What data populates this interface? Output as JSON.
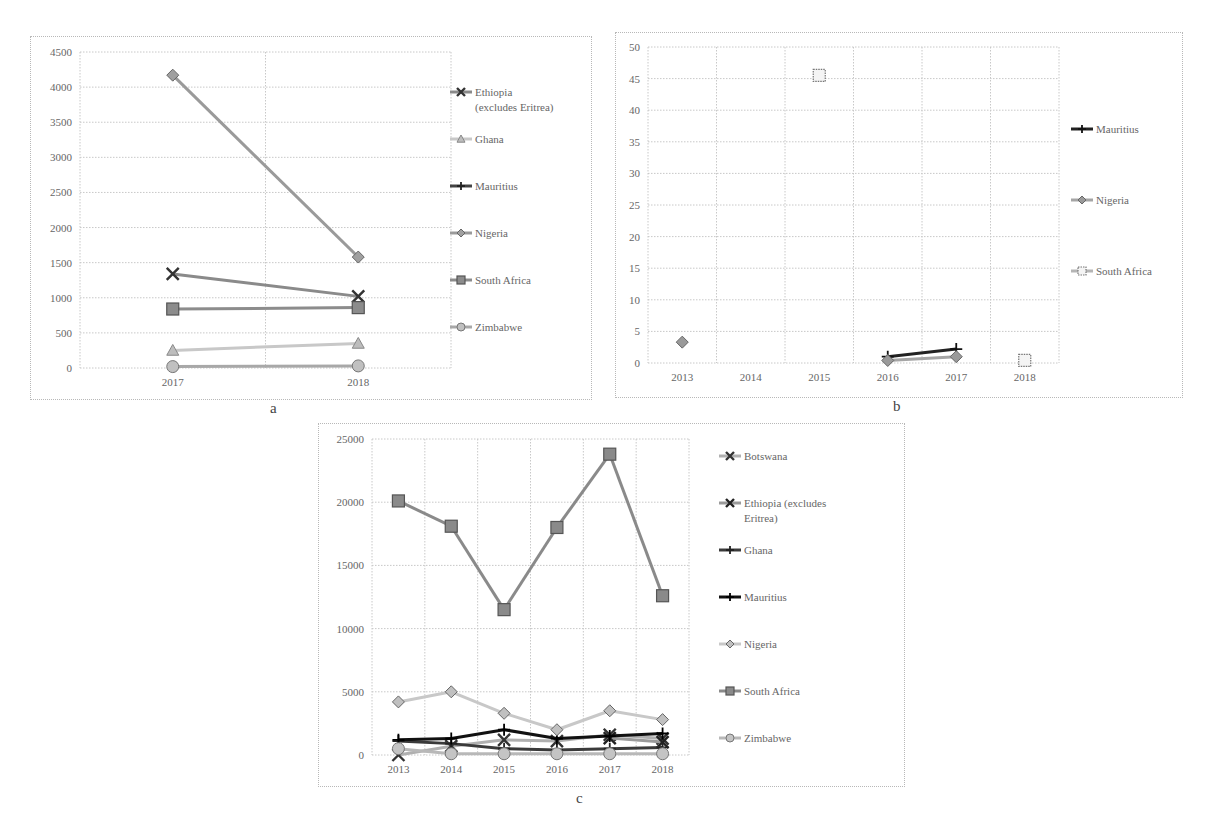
{
  "figure": {
    "captions": [
      "a",
      "b",
      "c"
    ]
  },
  "chart_data": [
    {
      "id": "a",
      "type": "line",
      "title": "",
      "xlabel": "",
      "ylabel": "",
      "categories": [
        "2017",
        "2018"
      ],
      "ylim": [
        0,
        4500
      ],
      "yticks": [
        0,
        500,
        1000,
        1500,
        2000,
        2500,
        3000,
        3500,
        4000,
        4500
      ],
      "grid": true,
      "legend_position": "right",
      "series": [
        {
          "name": "Ethiopia (excludes Eritrea)",
          "legend_lines": [
            "Ethiopia",
            "(excludes Eritrea)"
          ],
          "marker": "x",
          "color": "#8a8a8a",
          "marker_color": "#333333",
          "values": [
            1340,
            1020
          ]
        },
        {
          "name": "Ghana",
          "legend_lines": [
            "Ghana"
          ],
          "marker": "triangle",
          "color": "#c8c8c8",
          "marker_color": "#bdbdbd",
          "values": [
            250,
            350
          ]
        },
        {
          "name": "Mauritius",
          "legend_lines": [
            "Mauritius"
          ],
          "marker": "plus",
          "color": "#444444",
          "marker_color": "#222222",
          "values": [
            null,
            null
          ]
        },
        {
          "name": "Nigeria",
          "legend_lines": [
            "Nigeria"
          ],
          "marker": "diamond",
          "color": "#9a9a9a",
          "marker_color": "#a0a0a0",
          "values": [
            4170,
            1580
          ]
        },
        {
          "name": "South Africa",
          "legend_lines": [
            "South Africa"
          ],
          "marker": "square",
          "color": "#8c8c8c",
          "marker_color": "#8c8c8c",
          "values": [
            840,
            860
          ]
        },
        {
          "name": "Zimbabwe",
          "legend_lines": [
            "Zimbabwe"
          ],
          "marker": "circle",
          "color": "#a8a8a8",
          "marker_color": "#c0c0c0",
          "values": [
            20,
            30
          ]
        }
      ]
    },
    {
      "id": "b",
      "type": "line",
      "title": "",
      "xlabel": "",
      "ylabel": "",
      "categories": [
        "2013",
        "2014",
        "2015",
        "2016",
        "2017",
        "2018"
      ],
      "ylim": [
        0,
        50
      ],
      "yticks": [
        0,
        5,
        10,
        15,
        20,
        25,
        30,
        35,
        40,
        45,
        50
      ],
      "grid": true,
      "legend_position": "right",
      "series": [
        {
          "name": "Mauritius",
          "legend_lines": [
            "Mauritius"
          ],
          "marker": "plus",
          "color": "#222222",
          "marker_color": "#111111",
          "values": [
            null,
            null,
            null,
            1.0,
            2.2,
            null
          ]
        },
        {
          "name": "Nigeria",
          "legend_lines": [
            "Nigeria"
          ],
          "marker": "diamond",
          "color": "#a5a5a5",
          "marker_color": "#9a9a9a",
          "values": [
            3.3,
            null,
            null,
            0.4,
            1.0,
            null
          ]
        },
        {
          "name": "South Africa",
          "legend_lines": [
            "South Africa"
          ],
          "marker": "square-open",
          "color": "#b5b5b5",
          "marker_color": "#8a8a8a",
          "values": [
            null,
            null,
            45.5,
            null,
            null,
            0.4
          ]
        }
      ]
    },
    {
      "id": "c",
      "type": "line",
      "title": "",
      "xlabel": "",
      "ylabel": "",
      "categories": [
        "2013",
        "2014",
        "2015",
        "2016",
        "2017",
        "2018"
      ],
      "ylim": [
        0,
        25000
      ],
      "yticks": [
        0,
        5000,
        10000,
        15000,
        20000,
        25000
      ],
      "grid": true,
      "legend_position": "right",
      "series": [
        {
          "name": "Botswana",
          "legend_lines": [
            "Botswana"
          ],
          "marker": "x",
          "color": "#b0b0b0",
          "marker_color": "#333333",
          "values": [
            0,
            700,
            1200,
            1100,
            1600,
            1300
          ]
        },
        {
          "name": "Ethiopia (excludes Eritrea)",
          "legend_lines": [
            "Ethiopia (excludes",
            "Eritrea)"
          ],
          "marker": "x",
          "color": "#9a9a9a",
          "marker_color": "#222222",
          "values": [
            null,
            null,
            null,
            null,
            1340,
            1020
          ]
        },
        {
          "name": "Ghana",
          "legend_lines": [
            "Ghana"
          ],
          "marker": "plus",
          "color": "#3a3a3a",
          "marker_color": "#222222",
          "values": [
            1100,
            900,
            500,
            400,
            500,
            600
          ]
        },
        {
          "name": "Mauritius",
          "legend_lines": [
            "Mauritius"
          ],
          "marker": "plus",
          "color": "#111111",
          "marker_color": "#000000",
          "values": [
            1200,
            1300,
            2000,
            1300,
            1500,
            1700
          ]
        },
        {
          "name": "Nigeria",
          "legend_lines": [
            "Nigeria"
          ],
          "marker": "diamond",
          "color": "#c8c8c8",
          "marker_color": "#c0c0c0",
          "values": [
            4200,
            5000,
            3300,
            2000,
            3500,
            2800
          ]
        },
        {
          "name": "South Africa",
          "legend_lines": [
            "South Africa"
          ],
          "marker": "square",
          "color": "#8a8a8a",
          "marker_color": "#8a8a8a",
          "values": [
            20100,
            18100,
            11500,
            18000,
            23800,
            12600
          ]
        },
        {
          "name": "Zimbabwe",
          "legend_lines": [
            "Zimbabwe"
          ],
          "marker": "circle",
          "color": "#b8b8b8",
          "marker_color": "#c4c4c4",
          "values": [
            500,
            100,
            100,
            100,
            100,
            100
          ]
        }
      ]
    }
  ]
}
